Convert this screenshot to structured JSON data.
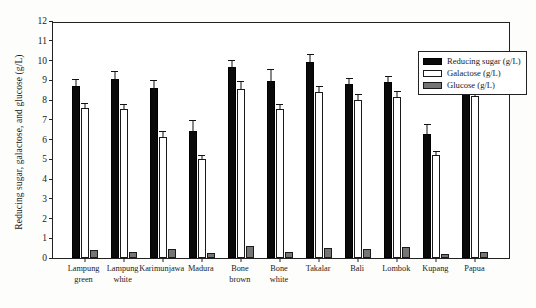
{
  "chart_data": {
    "type": "bar",
    "title": "",
    "xlabel": "",
    "ylabel": "Reducing sugar, galactose, and glucose (g/L)",
    "ylim": [
      0,
      12
    ],
    "ytick_labels": [
      "12",
      "11",
      "10",
      "9",
      "8",
      "7",
      "6",
      "5",
      "4",
      "3",
      "2",
      "1",
      "0"
    ],
    "ytick_values": [
      12,
      11,
      10,
      9,
      8,
      7,
      6,
      5,
      4,
      3,
      2,
      1,
      0
    ],
    "grid": false,
    "legend_position": "top-right",
    "error_bars": true,
    "categories": [
      "Lampung\ngreen",
      "Lampung\nwhite",
      "Karimunjawa",
      "Madura",
      "Bone\nbrown",
      "Bone\nwhite",
      "Takalar",
      "Bali",
      "Lombok",
      "Kupang",
      "Papua"
    ],
    "series": [
      {
        "name": "Reducing sugar (g/L)",
        "color": "#0a0a0a",
        "values": [
          8.7,
          9.05,
          8.62,
          6.45,
          9.65,
          8.95,
          9.95,
          8.8,
          8.9,
          6.3,
          8.9
        ],
        "errors": [
          0.38,
          0.42,
          0.4,
          0.55,
          0.4,
          0.62,
          0.4,
          0.32,
          0.32,
          0.5,
          0.35
        ]
      },
      {
        "name": "Galactose (g/L)",
        "color": "#ffffff",
        "values": [
          7.6,
          7.55,
          6.12,
          5.02,
          8.55,
          7.52,
          8.4,
          8.02,
          8.15,
          5.2,
          8.2
        ],
        "errors": [
          0.26,
          0.25,
          0.3,
          0.22,
          0.4,
          0.28,
          0.32,
          0.28,
          0.32,
          0.22,
          0.28
        ]
      },
      {
        "name": "Glucose (g/L)",
        "color": "#757575",
        "values": [
          0.4,
          0.3,
          0.45,
          0.25,
          0.6,
          0.3,
          0.5,
          0.45,
          0.55,
          0.2,
          0.3
        ],
        "errors": [
          0,
          0,
          0,
          0,
          0,
          0,
          0,
          0,
          0,
          0,
          0
        ]
      }
    ]
  },
  "legend": {
    "items": [
      {
        "label": "Reducing sugar (g/L)",
        "swatch": "reducing"
      },
      {
        "label": "Galactose (g/L)",
        "swatch": "galactose"
      },
      {
        "label": "Glucose (g/L)",
        "swatch": "glucose"
      }
    ]
  }
}
